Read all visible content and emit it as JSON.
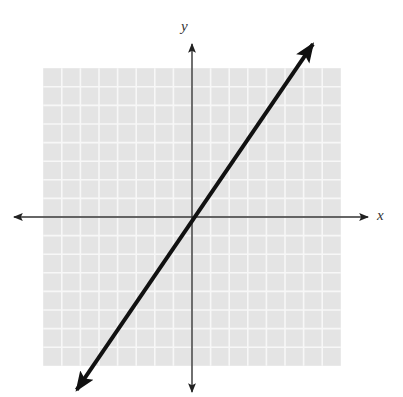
{
  "chart_data": {
    "type": "line",
    "title": "",
    "xlabel": "x",
    "ylabel": "y",
    "grid": true,
    "grid_cells": {
      "x": [
        -8,
        8
      ],
      "y": [
        -8,
        8
      ]
    },
    "xlim": [
      -9,
      9
    ],
    "ylim": [
      -9,
      9
    ],
    "tick_labels": false,
    "series": [
      {
        "name": "line",
        "equation": "y = 1.5x",
        "slope": 1.5,
        "intercept": 0,
        "arrows_both_ends": true,
        "x": [
          -6.2,
          6.5
        ],
        "y": [
          -9.3,
          9.3
        ]
      }
    ]
  },
  "labels": {
    "x_axis": "x",
    "y_axis": "y"
  },
  "colors": {
    "grid_fill": "#e4e4e4",
    "grid_line": "#f7f7f7",
    "axis": "#333333",
    "line": "#111111",
    "background": "#ffffff"
  }
}
